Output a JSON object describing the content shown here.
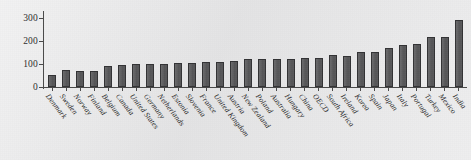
{
  "chart_data": {
    "type": "bar",
    "title": "",
    "subtitle": "",
    "xlabel": "",
    "ylabel": "",
    "ylim": [
      0,
      320
    ],
    "yticks": [
      0,
      100,
      200,
      300
    ],
    "ytick_labels": [
      "0",
      "100",
      "200",
      "300"
    ],
    "grid": false,
    "legend": null,
    "bar_color": "#5b5b5d",
    "bar_edge_color": "#333335",
    "background_color": "#e7e7e8",
    "axis_color": "#4a4a4a",
    "categories": [
      "Denmark",
      "Sweden",
      "Norway",
      "Finland",
      "Belgium",
      "Canada",
      "United States",
      "Germany",
      "Netherlands",
      "Estonia",
      "Slovenia",
      "France",
      "United Kingdom",
      "Austria",
      "New Zealand",
      "Poland",
      "Australia",
      "Hungary",
      "China",
      "OECD",
      "South Africa",
      "Ireland",
      "Korea",
      "Spain",
      "Japan",
      "Italy",
      "Portugal",
      "Turkey",
      "Mexico",
      "India"
    ],
    "values": [
      52,
      72,
      70,
      70,
      90,
      94,
      101,
      101,
      101,
      105,
      106,
      110,
      110,
      113,
      122,
      122,
      122,
      123,
      124,
      127,
      140,
      136,
      152,
      152,
      168,
      180,
      186,
      215,
      215,
      288
    ]
  }
}
